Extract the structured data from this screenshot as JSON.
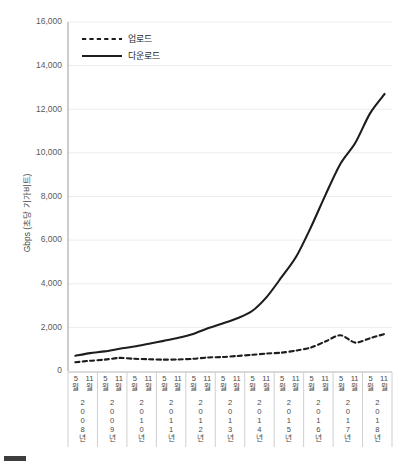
{
  "chart_data": {
    "type": "line",
    "title": "",
    "xlabel": "",
    "ylabel": "Gbps (초당 기가비트)",
    "ylim": [
      0,
      16000
    ],
    "ytick_labels": [
      "0",
      "2,000",
      "4,000",
      "6,000",
      "8,000",
      "10,000",
      "12,000",
      "14,000",
      "16,000"
    ],
    "ytick_values": [
      0,
      2000,
      4000,
      6000,
      8000,
      10000,
      12000,
      14000,
      16000
    ],
    "grid": true,
    "legend_position": "top-left",
    "month_labels": [
      "5월",
      "11월"
    ],
    "categories": [
      "2008년 5월",
      "2008년 11월",
      "2009년 5월",
      "2009년 11월",
      "2010년 5월",
      "2010년 11월",
      "2011년 5월",
      "2011년 11월",
      "2012년 5월",
      "2012년 11월",
      "2013년 5월",
      "2013년 11월",
      "2014년 5월",
      "2014년 11월",
      "2015년 5월",
      "2015년 11월",
      "2016년 5월",
      "2016년 11월",
      "2017년 5월",
      "2017년 11월",
      "2018년 5월",
      "2018년 11월"
    ],
    "years": [
      {
        "label": "2008년",
        "chars": [
          "2",
          "0",
          "0",
          "8",
          "년"
        ]
      },
      {
        "label": "2009년",
        "chars": [
          "2",
          "0",
          "0",
          "9",
          "년"
        ]
      },
      {
        "label": "2010년",
        "chars": [
          "2",
          "0",
          "1",
          "0",
          "년"
        ]
      },
      {
        "label": "2011년",
        "chars": [
          "2",
          "0",
          "1",
          "1",
          "년"
        ]
      },
      {
        "label": "2012년",
        "chars": [
          "2",
          "0",
          "1",
          "2",
          "년"
        ]
      },
      {
        "label": "2013년",
        "chars": [
          "2",
          "0",
          "1",
          "3",
          "년"
        ]
      },
      {
        "label": "2014년",
        "chars": [
          "2",
          "0",
          "1",
          "4",
          "년"
        ]
      },
      {
        "label": "2015년",
        "chars": [
          "2",
          "0",
          "1",
          "5",
          "년"
        ]
      },
      {
        "label": "2016년",
        "chars": [
          "2",
          "0",
          "1",
          "6",
          "년"
        ]
      },
      {
        "label": "2017년",
        "chars": [
          "2",
          "0",
          "1",
          "7",
          "년"
        ]
      },
      {
        "label": "2018년",
        "chars": [
          "2",
          "0",
          "1",
          "8",
          "년"
        ]
      }
    ],
    "series": [
      {
        "name": "업로드",
        "style": "dashed",
        "color": "#1d1d1d",
        "values": [
          400,
          470,
          520,
          600,
          560,
          540,
          520,
          530,
          560,
          620,
          640,
          690,
          740,
          800,
          840,
          940,
          1080,
          1360,
          1640,
          1300,
          1500,
          1700
        ]
      },
      {
        "name": "다운로드",
        "style": "solid",
        "color": "#1d1d1d",
        "values": [
          700,
          820,
          900,
          1020,
          1120,
          1250,
          1380,
          1520,
          1700,
          1960,
          2180,
          2420,
          2750,
          3400,
          4300,
          5250,
          6600,
          8100,
          9500,
          10450,
          11800,
          12700
        ]
      }
    ]
  },
  "legend": {
    "items": [
      {
        "label": "업로드",
        "style": "dashed"
      },
      {
        "label": "다운로드",
        "style": "solid"
      }
    ]
  },
  "caption": {
    "text": ""
  }
}
